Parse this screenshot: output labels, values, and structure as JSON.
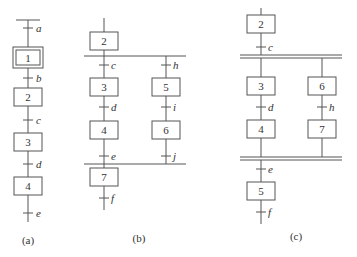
{
  "diagrams": [
    {
      "id": "a",
      "caption": "(a)",
      "type": "single-sequence",
      "steps": [
        {
          "label": "1",
          "initial": true
        },
        {
          "label": "2"
        },
        {
          "label": "3"
        },
        {
          "label": "4"
        }
      ],
      "transitions": [
        "a",
        "b",
        "c",
        "d",
        "e"
      ]
    },
    {
      "id": "b",
      "caption": "(b)",
      "type": "selective-branch",
      "steps": [
        {
          "label": "2"
        },
        {
          "label": "3"
        },
        {
          "label": "4"
        },
        {
          "label": "5"
        },
        {
          "label": "6"
        },
        {
          "label": "7"
        }
      ],
      "transitions": [
        "c",
        "d",
        "e",
        "h",
        "i",
        "j",
        "f"
      ]
    },
    {
      "id": "c",
      "caption": "(c)",
      "type": "parallel-branch",
      "steps": [
        {
          "label": "2"
        },
        {
          "label": "3"
        },
        {
          "label": "4"
        },
        {
          "label": "6"
        },
        {
          "label": "7"
        },
        {
          "label": "5"
        }
      ],
      "transitions": [
        "c",
        "d",
        "h",
        "e",
        "f"
      ]
    }
  ]
}
